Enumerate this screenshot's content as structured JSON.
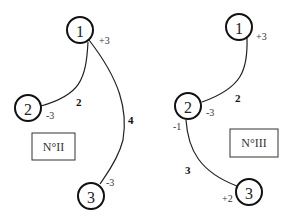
{
  "diagrams": [
    {
      "id": "II",
      "label": "N°II",
      "nodes": [
        {
          "id": "1",
          "label": "1",
          "charge": "+3"
        },
        {
          "id": "2",
          "label": "2",
          "charge": "-3"
        },
        {
          "id": "3",
          "label": "3",
          "charge": "-3"
        }
      ],
      "edges": [
        {
          "from": "1",
          "to": "2",
          "weight": "2"
        },
        {
          "from": "1",
          "to": "3",
          "weight": "4"
        }
      ]
    },
    {
      "id": "III",
      "label": "N°III",
      "nodes": [
        {
          "id": "1",
          "label": "1",
          "charge": "+3"
        },
        {
          "id": "2",
          "label": "2",
          "charge": "-3",
          "secondary_charge": "-1"
        },
        {
          "id": "3",
          "label": "3",
          "charge": "+2"
        }
      ],
      "edges": [
        {
          "from": "1",
          "to": "2",
          "weight": "2"
        },
        {
          "from": "2",
          "to": "3",
          "weight": "3"
        }
      ]
    }
  ],
  "colors": {
    "stroke": "#111111",
    "background": "#ffffff"
  }
}
